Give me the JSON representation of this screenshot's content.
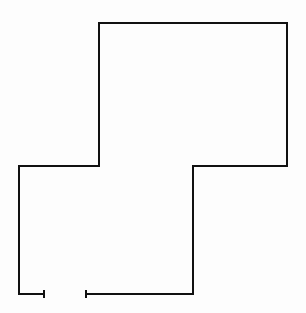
{
  "diagram": {
    "type": "floor-plan-outline",
    "stroke_color": "#111111",
    "stroke_width": 2,
    "background": "#fdfdfd",
    "wall_path": [
      [
        44,
        294
      ],
      [
        19,
        294
      ],
      [
        19,
        166
      ],
      [
        99,
        166
      ],
      [
        99,
        23
      ],
      [
        287,
        23
      ],
      [
        287,
        166
      ],
      [
        193,
        166
      ],
      [
        193,
        294
      ],
      [
        86,
        294
      ]
    ],
    "opening": {
      "label": "door-opening",
      "left_end": [
        44,
        294
      ],
      "right_end": [
        86,
        294
      ]
    }
  }
}
